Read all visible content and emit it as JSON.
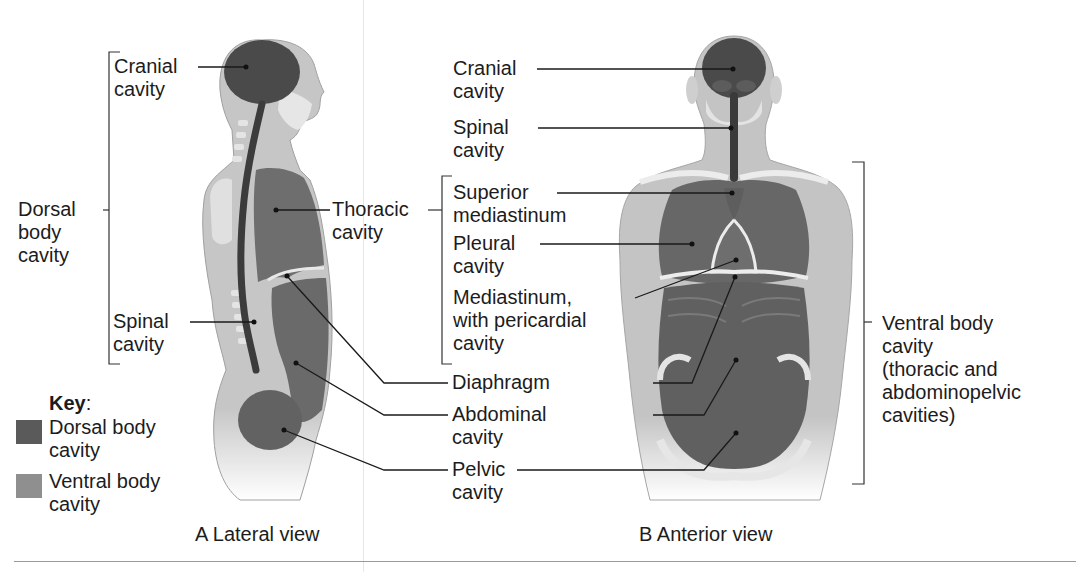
{
  "figure": {
    "panels": [
      {
        "id": "A",
        "caption": "A Lateral view",
        "labels": {
          "cranial": [
            "Cranial",
            "cavity"
          ],
          "dorsal": [
            "Dorsal",
            "body",
            "cavity"
          ],
          "thoracic": [
            "Thoracic",
            "cavity"
          ],
          "spinal": [
            "Spinal",
            "cavity"
          ]
        }
      },
      {
        "id": "B",
        "caption": "B Anterior view",
        "labels": {
          "cranial": [
            "Cranial",
            "cavity"
          ],
          "spinal": [
            "Spinal",
            "cavity"
          ],
          "superior_mediastinum": [
            "Superior",
            "mediastinum"
          ],
          "pleural": [
            "Pleural",
            "cavity"
          ],
          "mediastinum": [
            "Mediastinum,",
            "with pericardial",
            "cavity"
          ],
          "ventral": [
            "Ventral body",
            "cavity",
            "(thoracic and",
            "abdominopelvic",
            "cavities)"
          ]
        }
      }
    ],
    "shared_labels": {
      "diaphragm": "Diaphragm",
      "abdominal": [
        "Abdominal",
        "cavity"
      ],
      "pelvic": [
        "Pelvic",
        "cavity"
      ]
    },
    "key": {
      "title": "Key",
      "title_suffix": ":",
      "items": [
        {
          "label": [
            "Dorsal body",
            "cavity"
          ],
          "color": "#5a5a5a"
        },
        {
          "label": [
            "Ventral body",
            "cavity"
          ],
          "color": "#8f8f8f"
        }
      ]
    }
  },
  "colors": {
    "dorsal": "#4e4e4e",
    "ventral": "#7d7d7d",
    "body": "#c9c9c9",
    "bone": "#e9e9e9",
    "line": "#1a1a1a"
  }
}
